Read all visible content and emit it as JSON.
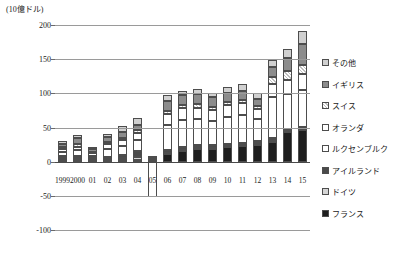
{
  "chart_data": {
    "type": "bar",
    "stacked": true,
    "title": "",
    "unit_label": "(10億ドル)",
    "xlabel": "",
    "ylabel": "",
    "ylim": [
      -100,
      200
    ],
    "yticks": [
      200,
      150,
      100,
      50,
      0,
      -50,
      -100
    ],
    "ytick_labels": [
      "200",
      "150",
      "100",
      "50",
      "0",
      "-50",
      "-100"
    ],
    "grid": true,
    "legend_position": "right",
    "categories": [
      "1999",
      "2000",
      "01",
      "02",
      "03",
      "04",
      "05",
      "06",
      "07",
      "08",
      "09",
      "10",
      "11",
      "12",
      "13",
      "14",
      "15"
    ],
    "series": [
      {
        "name": "フランス",
        "color": "#1e1e1e",
        "pattern": "solid",
        "values": [
          3,
          3,
          1,
          2,
          3,
          3,
          1,
          11,
          15,
          19,
          18,
          21,
          23,
          25,
          29,
          43,
          46
        ]
      },
      {
        "name": "ドイツ",
        "color": "#d5d5d5",
        "pattern": "solid",
        "values": [
          2,
          2,
          1,
          2,
          3,
          4,
          0,
          2,
          2,
          2,
          2,
          2,
          2,
          2,
          2,
          2,
          2
        ]
      },
      {
        "name": "アイルランド",
        "color": "#4a4a4a",
        "pattern": "solid",
        "values": [
          3,
          4,
          3,
          3,
          4,
          8,
          1,
          4,
          4,
          4,
          4,
          3,
          3,
          3,
          3,
          3,
          3
        ]
      },
      {
        "name": "ルクセンブルク",
        "color": "#ffffff",
        "pattern": "solid",
        "values": [
          6,
          8,
          4,
          12,
          13,
          17,
          -52,
          36,
          40,
          38,
          35,
          40,
          41,
          33,
          60,
          51,
          54
        ]
      },
      {
        "name": "オランダ",
        "color": "#ffffff",
        "pattern": "solid",
        "values": [
          4,
          5,
          3,
          7,
          8,
          10,
          1,
          17,
          17,
          16,
          16,
          17,
          17,
          14,
          19,
          21,
          23
        ]
      },
      {
        "name": "スイス",
        "color": "#bdbdbd",
        "pattern": "hatch",
        "values": [
          3,
          4,
          2,
          3,
          4,
          4,
          1,
          4,
          5,
          5,
          5,
          4,
          4,
          4,
          11,
          13,
          14
        ]
      },
      {
        "name": "イギリス",
        "color": "#8c8c8c",
        "pattern": "solid",
        "values": [
          5,
          9,
          5,
          7,
          9,
          8,
          2,
          15,
          14,
          15,
          14,
          14,
          14,
          10,
          14,
          19,
          30
        ]
      },
      {
        "name": "その他",
        "color": "#d0d0d0",
        "pattern": "solid",
        "values": [
          4,
          4,
          3,
          5,
          8,
          10,
          2,
          9,
          7,
          7,
          7,
          8,
          10,
          10,
          11,
          13,
          19
        ]
      }
    ],
    "legend_entries": [
      "その他",
      "イギリス",
      "スイス",
      "オランダ",
      "ルクセンブルク",
      "アイルランド",
      "ドイツ",
      "フランス"
    ]
  }
}
